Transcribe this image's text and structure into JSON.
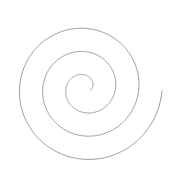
{
  "canvas": {
    "width": 170,
    "height": 177,
    "background_color": "#ffffff",
    "title": "spiral-figure"
  },
  "figure": {
    "type": "archimedean-spiral",
    "stroke_color": "#8a8a8a",
    "stroke_width": 0.9,
    "fill": "none"
  },
  "chart_data": {
    "type": "line",
    "title": "",
    "subtitle": "",
    "xlabel": "",
    "ylabel": "",
    "grid": false,
    "legend": null,
    "curve": "archimedean-spiral",
    "center_x": 85,
    "center_y": 88,
    "inner_radius": 6,
    "outer_radius": 77,
    "turns": 3.05,
    "start_angle_deg": 20,
    "direction": "counter-clockwise",
    "samples": 1400,
    "radial_growth_per_half_turn": 23,
    "extents": {
      "top_y": 10,
      "bottom_y": 165,
      "left_x": 10,
      "right_x": 160
    },
    "vertical_crossings_above_center": [
      10,
      32,
      55
    ],
    "vertical_crossings_below_center": [
      105,
      128,
      152
    ]
  }
}
